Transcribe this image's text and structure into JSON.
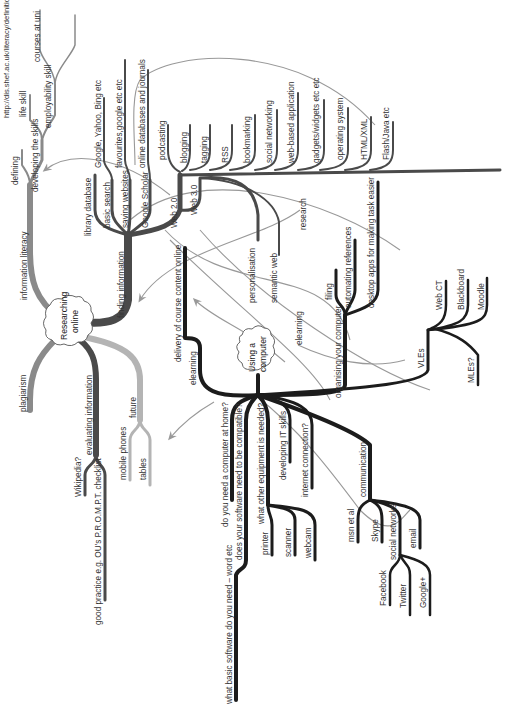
{
  "diagram": {
    "type": "mind-map",
    "orientation": "rotated-90-ccw",
    "colors": {
      "dark_branch": "#1c1c1c",
      "mid_branch": "#4a4a4a",
      "grey_branch": "#8a8a8a",
      "light_branch": "#b4b4b4",
      "link": "#999999"
    },
    "central_nodes": {
      "researching": "Researching online",
      "researching_l1": "Researching",
      "researching_l2": "online",
      "computer": "Using a computer",
      "computer_l1": "Using a",
      "computer_l2": "computer"
    },
    "researching_online": {
      "information_literacy": "information literacy",
      "defining": "defining",
      "developing_skills": "developing the skills",
      "life_skill": "life skill",
      "employability_skill": "employability skill",
      "url": "http://dis.shef.ac.uk/literacy/definition",
      "courses_at_uni": "courses at uni",
      "finding_information": "finding information",
      "library_database": "library database",
      "basic_search": "basic search",
      "google_yahoo_bing": "Google, Yahoo, Bing etc",
      "saving_websites": "saving websites",
      "favourites": "favourites,google etc etc",
      "google_scholar": "Google Scholar",
      "online_databases": "online databases and journals",
      "web20": "Web 2.0",
      "web30": "Web 3.0",
      "podcasting": "podcasting",
      "blogging": "blogging",
      "tagging": "tagging",
      "rss": "RSS",
      "bookmarking": "bookmarking",
      "social_networking": "social networking",
      "web_based_application": "web-based application",
      "gadgets_widgets": "gadgets/widgets etc etc",
      "operating_system": "operating system",
      "html_xml": "HTML/XML",
      "flash_java": "Flash/Java etc",
      "personalisation": "personalisation",
      "semantic_web": "semantic web",
      "research": "research",
      "plagiarism": "plagiarism",
      "evaluating_information": "evaluating information",
      "wikipedia": "Wikipedia?",
      "good_practice": "good practice e.g. OU's P.R.O.M.P.T. checklist",
      "future": "future",
      "mobile_phones": "mobile phones",
      "tablets": "tables"
    },
    "using_a_computer": {
      "elearning": "elearning",
      "delivery": "delivery of course content online",
      "elearning_link": "elearning",
      "organising": "organising your computer",
      "filing": "filing",
      "automating_references": "automating references",
      "desktop_apps": "desktop apps for making task easier",
      "vles": "VLEs",
      "web_ct": "Web CT",
      "blackboard": "Blackboard",
      "moodle": "Moodle",
      "mles": "MLEs?",
      "need_computer_home": "do you need a computer at home?",
      "software_compatible": "does your software need to be compatible?",
      "basic_software": "what basic software do you need – word etc",
      "other_equipment": "what other equipment is needed?",
      "printer": "printer",
      "scanner": "scanner",
      "webcam": "webcam",
      "developing_it_skills": "developing IT skills",
      "internet_connection": "internet connection?",
      "communication": "communication",
      "msn": "msn et al",
      "skype": "Skype",
      "social_networks": "social networks",
      "email": "email",
      "facebook": "Facebook",
      "twitter": "Twitter",
      "google_plus": "Google+"
    }
  }
}
